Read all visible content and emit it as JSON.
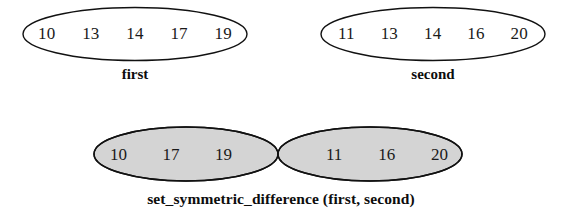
{
  "figure": {
    "background_color": "#ffffff",
    "stroke_color": "#111111",
    "fill_color": "#d4d4d4",
    "text_color": "#1a1a1a"
  },
  "sets": [
    {
      "name": "first",
      "label": "first",
      "members": [
        "10",
        "13",
        "14",
        "17",
        "19"
      ]
    },
    {
      "name": "second",
      "label": "second",
      "members": [
        "11",
        "13",
        "14",
        "16",
        "20"
      ]
    }
  ],
  "venn": {
    "caption": "set_symmetric_difference (first, second)",
    "left_only": {
      "name": "first-only",
      "members": [
        "10",
        "17",
        "19"
      ],
      "shaded": true
    },
    "intersection": {
      "name": "intersection",
      "members": [],
      "shaded": false
    },
    "right_only": {
      "name": "second-only",
      "members": [
        "11",
        "16",
        "20"
      ],
      "shaded": true
    }
  }
}
